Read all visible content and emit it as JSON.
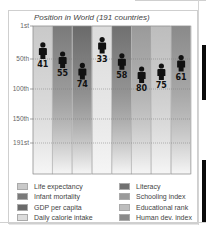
{
  "chart_data": {
    "type": "bar",
    "title": "Position in World (191 countries)",
    "xlabel": "",
    "ylabel": "",
    "y_axis_inverted": true,
    "ylim": [
      1,
      191
    ],
    "y_ticks": [
      {
        "value": 1,
        "label": "1st"
      },
      {
        "value": 50,
        "label": "50th"
      },
      {
        "value": 100,
        "label": "100th"
      },
      {
        "value": 150,
        "label": "150th"
      },
      {
        "value": 191,
        "label": "191st"
      }
    ],
    "grid": true,
    "marker": "person-icon",
    "categories": [
      "Life expectancy",
      "Infant mortality",
      "GDP per capita",
      "Daily calorie intake",
      "Literacy",
      "Schooling index",
      "Educational rank",
      "Human dev. index"
    ],
    "values": [
      41,
      55,
      74,
      33,
      58,
      80,
      75,
      61
    ],
    "colors": [
      "#c9c9c9",
      "#7a7a7a",
      "#6a6a6a",
      "#dcdcdc",
      "#707070",
      "#9a9a9a",
      "#bdbdbd",
      "#8a8a8a"
    ],
    "legend_position": "bottom"
  }
}
